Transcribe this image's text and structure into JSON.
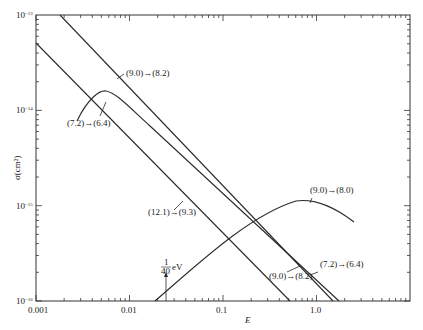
{
  "chart_data": {
    "type": "line",
    "title": "",
    "xlabel": "E",
    "ylabel": "σ(cm²)",
    "xscale": "log",
    "yscale": "log",
    "xlim": [
      0.001,
      10
    ],
    "ylim": [
      1e-16,
      1e-13
    ],
    "grid": false,
    "x_tick_labels": [
      "0.001",
      "0.01",
      "0.1",
      "1.0"
    ],
    "y_tick_labels": [
      "10⁻¹³",
      "10⁻¹⁴",
      "10⁻¹⁵",
      "10⁻¹⁶"
    ],
    "series": [
      {
        "name": "(9.0)→(8.2)",
        "points": [
          [
            0.0018,
            1e-13
          ],
          [
            0.01,
            3.5e-14
          ],
          [
            0.1,
            3.2e-15
          ],
          [
            1.0,
            2.8e-16
          ],
          [
            1.6,
            1e-16
          ]
        ]
      },
      {
        "name": "(7.2)→(6.4)",
        "points": [
          [
            0.0027,
            9.5e-15
          ],
          [
            0.004,
            1.45e-14
          ],
          [
            0.006,
            1.5e-14
          ],
          [
            0.01,
            1.1e-14
          ],
          [
            0.1,
            2.9e-15
          ],
          [
            1.0,
            3e-16
          ],
          [
            1.8,
            1e-16
          ]
        ]
      },
      {
        "name": "(12.1)→(9.3)",
        "points": [
          [
            0.001,
            5e-14
          ],
          [
            0.01,
            5.5e-15
          ],
          [
            0.1,
            5.5e-16
          ],
          [
            0.55,
            1e-16
          ]
        ]
      },
      {
        "name": "(9.0)→(8.0)",
        "points": [
          [
            0.018,
            1e-16
          ],
          [
            0.1,
            4e-16
          ],
          [
            0.3,
            9e-16
          ],
          [
            0.6,
            1.05e-15
          ],
          [
            1.0,
            9e-16
          ],
          [
            2.5,
            6.3e-16
          ]
        ]
      }
    ],
    "annotations": [
      {
        "text": "(9.0)→(8.2)",
        "x": 0.03,
        "y": 2.8e-14
      },
      {
        "text": "(7.2)→(6.4)",
        "x": 0.0025,
        "y": 8e-15
      },
      {
        "text": "(12.1)→(9.3)",
        "x": 0.02,
        "y": 5e-16
      },
      {
        "text": "(9.0)→(8.0)",
        "x": 0.5,
        "y": 1.4e-15
      },
      {
        "text": "(9.0)→(8.2)",
        "x": 0.5,
        "y": 1.5e-16
      },
      {
        "text": "(7.2)→(6.4)",
        "x": 1.3,
        "y": 1.8e-16
      },
      {
        "text": "1/40 eV",
        "x": 0.025,
        "y": 2e-16
      }
    ]
  },
  "axes": {
    "xlabel": "E",
    "ylabel": "σ(cm²)",
    "x_ticks": [
      {
        "label": "0.001",
        "x": 36
      },
      {
        "label": "0.01",
        "x": 130
      },
      {
        "label": "0.1",
        "x": 223
      },
      {
        "label": "1.0",
        "x": 317
      }
    ],
    "y_ticks": [
      {
        "base": "10",
        "exp": "−13",
        "y": 15
      },
      {
        "base": "10",
        "exp": "−14",
        "y": 110
      },
      {
        "base": "10",
        "exp": "−15",
        "y": 206
      },
      {
        "base": "10",
        "exp": "−16",
        "y": 301
      }
    ]
  },
  "labels": {
    "l1": "(9.0)→(8.2)",
    "l2": "(7.2)→(6.4)",
    "l3": "(12.1)→(9.3)",
    "l4": "(9.0)→(8.0)",
    "l5": "(9.0)→(8.2)",
    "l6": "(7.2)→(6.4)",
    "frac_num": "1",
    "frac_den": "40",
    "frac_unit": "eV"
  }
}
